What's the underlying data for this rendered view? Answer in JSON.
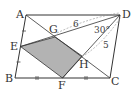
{
  "diagram": {
    "type": "geometry-parallelogram",
    "points": {
      "A": {
        "label": "A",
        "x": 26,
        "y": 15
      },
      "B": {
        "label": "B",
        "x": 15,
        "y": 78
      },
      "C": {
        "label": "C",
        "x": 110,
        "y": 78
      },
      "D": {
        "label": "D",
        "x": 120,
        "y": 15
      },
      "E": {
        "label": "E",
        "x": 20.5,
        "y": 46.5
      },
      "F": {
        "label": "F",
        "x": 62.5,
        "y": 78
      },
      "G": {
        "label": "G",
        "x": 55,
        "y": 37
      },
      "H": {
        "label": "H",
        "x": 82,
        "y": 56
      }
    },
    "annotations": {
      "DG_length": "6",
      "DH_length": "5",
      "angle_GDH": "30°"
    },
    "shaded_region": "EGHF",
    "colors": {
      "line": "#333333",
      "shade": "#b3b3b3",
      "dashed": "#888888"
    }
  }
}
